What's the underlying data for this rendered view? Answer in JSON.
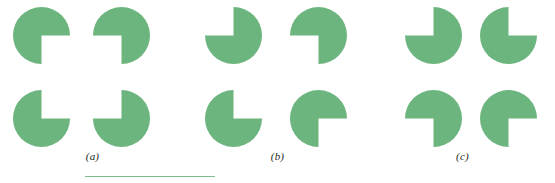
{
  "figure": {
    "name": "kanizsa-illusory-contour-figure",
    "background_color": "#ffffff",
    "inducer_color": "#6cb57f",
    "label_color": "#231f20",
    "width": 555,
    "height": 183
  },
  "panels": [
    {
      "id": "a",
      "label": "(a)",
      "inducers": [
        {
          "position": "top-left",
          "notch_quadrant": "bottom-right",
          "notch_start_deg": 0,
          "notch_sweep_deg": 90
        },
        {
          "position": "top-right",
          "notch_quadrant": "bottom-left",
          "notch_start_deg": 90,
          "notch_sweep_deg": 90
        },
        {
          "position": "bottom-left",
          "notch_quadrant": "top-right",
          "notch_start_deg": 270,
          "notch_sweep_deg": 90
        },
        {
          "position": "bottom-right",
          "notch_quadrant": "top-left",
          "notch_start_deg": 180,
          "notch_sweep_deg": 90
        }
      ]
    },
    {
      "id": "b",
      "label": "(b)",
      "inducers": [
        {
          "position": "top-left",
          "notch_quadrant": "top-left",
          "notch_start_deg": 180,
          "notch_sweep_deg": 90
        },
        {
          "position": "top-right",
          "notch_quadrant": "bottom-left",
          "notch_start_deg": 90,
          "notch_sweep_deg": 90
        },
        {
          "position": "bottom-left",
          "notch_quadrant": "top-right",
          "notch_start_deg": 270,
          "notch_sweep_deg": 90
        },
        {
          "position": "bottom-right",
          "notch_quadrant": "bottom-right",
          "notch_start_deg": 0,
          "notch_sweep_deg": 90
        }
      ]
    },
    {
      "id": "c",
      "label": "(c)",
      "inducers": [
        {
          "position": "top-left",
          "notch_quadrant": "top-left",
          "notch_start_deg": 180,
          "notch_sweep_deg": 90
        },
        {
          "position": "top-right",
          "notch_quadrant": "top-right",
          "notch_start_deg": 270,
          "notch_sweep_deg": 90
        },
        {
          "position": "bottom-left",
          "notch_quadrant": "bottom-left",
          "notch_start_deg": 90,
          "notch_sweep_deg": 90
        },
        {
          "position": "bottom-right",
          "notch_quadrant": "bottom-right",
          "notch_start_deg": 0,
          "notch_sweep_deg": 90
        }
      ]
    }
  ],
  "scale_rule": {
    "name": "scale-bar",
    "color": "#7cbf8e",
    "x": 85,
    "y": 176,
    "width": 130,
    "thickness": 1.5
  }
}
